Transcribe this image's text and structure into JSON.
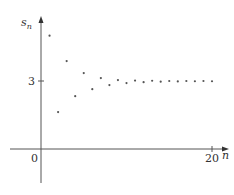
{
  "chart_data": {
    "type": "scatter",
    "title": "",
    "xlabel": "n",
    "ylabel": "s_n",
    "ylabel_main": "s",
    "ylabel_sub": "n",
    "x_ticks": [
      {
        "value": 0,
        "label": "0"
      },
      {
        "value": 20,
        "label": "20"
      }
    ],
    "y_ticks": [
      {
        "value": 3,
        "label": "3"
      }
    ],
    "xlim": [
      -3.5,
      21
    ],
    "ylim": [
      -1.5,
      5.8
    ],
    "grid": false,
    "legend": null,
    "series": [
      {
        "name": "s_n",
        "x": [
          1,
          2,
          3,
          4,
          5,
          6,
          7,
          8,
          9,
          10,
          11,
          12,
          13,
          14,
          15,
          16,
          17,
          18,
          19,
          20
        ],
        "values": [
          5.0,
          1.63,
          3.88,
          2.33,
          3.35,
          2.64,
          3.13,
          2.82,
          3.04,
          2.91,
          3.02,
          2.95,
          3.01,
          2.97,
          3.0,
          2.98,
          3.0,
          2.99,
          3.0,
          2.99
        ]
      }
    ],
    "annotations": [
      "Sequence converges to limit 3"
    ]
  },
  "style": {
    "axis_color": "#555555",
    "point_color": "#555555"
  }
}
